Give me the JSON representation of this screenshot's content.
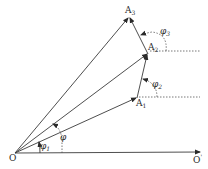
{
  "diagram": {
    "title": "",
    "points": {
      "O": {
        "label": "O",
        "x": 15,
        "y": 153
      },
      "O_prime": {
        "label": "O",
        "sup": "'",
        "x": 200,
        "y": 152
      },
      "A1": {
        "label": "A",
        "sub": "1",
        "x": 137,
        "y": 98
      },
      "A2": {
        "label": "A",
        "sub": "2",
        "x": 148,
        "y": 54
      },
      "A3": {
        "label": "A",
        "sub": "3",
        "x": 129,
        "y": 17
      }
    },
    "vectors": [
      {
        "from": "O",
        "to": "O_prime",
        "style": "solid",
        "arrow": true
      },
      {
        "from": "O",
        "to": "A1",
        "style": "solid",
        "arrow": true
      },
      {
        "from": "O",
        "to": "A2",
        "style": "solid",
        "arrow": true
      },
      {
        "from": "O",
        "to": "A3",
        "style": "solid",
        "arrow": true
      },
      {
        "from": "A1",
        "to": "A2",
        "style": "solid",
        "arrow": true
      },
      {
        "from": "A2",
        "to": "A3",
        "style": "solid",
        "arrow": true
      }
    ],
    "reference_lines": [
      {
        "from": "A1",
        "direction": "horizontal",
        "style": "dotted"
      },
      {
        "from": "A2",
        "direction": "horizontal",
        "style": "dotted"
      }
    ],
    "angles": [
      {
        "label": "φ",
        "sub": "",
        "between": [
          "OO'",
          "OA2"
        ],
        "style": "dotted"
      },
      {
        "label": "φ",
        "sub": "1",
        "between": [
          "OO'",
          "OA1"
        ],
        "style": "solid"
      },
      {
        "label": "φ",
        "sub": "2",
        "between": [
          "horizontal@A1",
          "A1A2"
        ],
        "style": "dotted"
      },
      {
        "label": "φ",
        "sub": "3",
        "between": [
          "horizontal@A2",
          "A2A3"
        ],
        "style": "dotted"
      }
    ],
    "colors": {
      "stroke": "#3a3a3a",
      "background": "#ffffff"
    }
  }
}
